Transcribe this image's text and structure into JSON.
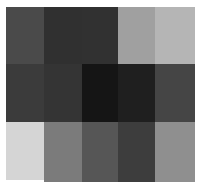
{
  "mosaic": {
    "background": "#ffffff",
    "rows": 3,
    "cols": 5,
    "cells": [
      {
        "row": 0,
        "col": 0,
        "x": 6,
        "y": 7,
        "w": 38,
        "h": 57,
        "color": "#4a4a4a"
      },
      {
        "row": 0,
        "col": 1,
        "x": 44,
        "y": 7,
        "w": 38,
        "h": 57,
        "color": "#303030"
      },
      {
        "row": 0,
        "col": 2,
        "x": 82,
        "y": 7,
        "w": 36,
        "h": 57,
        "color": "#313131"
      },
      {
        "row": 0,
        "col": 3,
        "x": 118,
        "y": 7,
        "w": 37,
        "h": 57,
        "color": "#a0a0a0"
      },
      {
        "row": 0,
        "col": 4,
        "x": 155,
        "y": 7,
        "w": 40,
        "h": 57,
        "color": "#b5b5b5"
      },
      {
        "row": 1,
        "col": 0,
        "x": 6,
        "y": 64,
        "w": 38,
        "h": 58,
        "color": "#3b3b3b"
      },
      {
        "row": 1,
        "col": 1,
        "x": 44,
        "y": 64,
        "w": 38,
        "h": 58,
        "color": "#343434"
      },
      {
        "row": 1,
        "col": 2,
        "x": 82,
        "y": 64,
        "w": 36,
        "h": 58,
        "color": "#151515"
      },
      {
        "row": 1,
        "col": 3,
        "x": 118,
        "y": 64,
        "w": 37,
        "h": 58,
        "color": "#1f1f1f"
      },
      {
        "row": 1,
        "col": 4,
        "x": 155,
        "y": 64,
        "w": 40,
        "h": 58,
        "color": "#454545"
      },
      {
        "row": 2,
        "col": 0,
        "x": 6,
        "y": 122,
        "w": 38,
        "h": 58,
        "color": "#d5d5d5"
      },
      {
        "row": 2,
        "col": 1,
        "x": 44,
        "y": 122,
        "w": 38,
        "h": 60,
        "color": "#7b7b7b"
      },
      {
        "row": 2,
        "col": 2,
        "x": 82,
        "y": 122,
        "w": 36,
        "h": 60,
        "color": "#565656"
      },
      {
        "row": 2,
        "col": 3,
        "x": 118,
        "y": 122,
        "w": 37,
        "h": 60,
        "color": "#3d3d3d"
      },
      {
        "row": 2,
        "col": 4,
        "x": 155,
        "y": 122,
        "w": 40,
        "h": 60,
        "color": "#8f8f8f"
      }
    ]
  }
}
